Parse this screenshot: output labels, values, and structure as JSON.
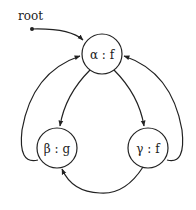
{
  "root_label": "root",
  "nodes": [
    {
      "id": "alpha",
      "label": "α : f"
    },
    {
      "id": "beta",
      "label": "β : g"
    },
    {
      "id": "gamma",
      "label": "γ : f"
    }
  ]
}
